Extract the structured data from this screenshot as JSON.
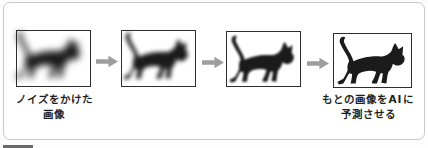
{
  "figure": {
    "steps": [
      {
        "name": "step-1-heavy-noise",
        "icon": "blurred-cat-silhouette"
      },
      {
        "name": "step-2-medium-noise",
        "icon": "blurred-cat-silhouette"
      },
      {
        "name": "step-3-light-noise",
        "icon": "cat-silhouette"
      },
      {
        "name": "step-4-clean-image",
        "icon": "cat-silhouette"
      }
    ],
    "arrow_icon": "right-arrow",
    "captions": {
      "left": {
        "line1": "ノイズをかけた",
        "line2": "画像"
      },
      "right": {
        "line1": "もとの画像をAIに",
        "line2": "予測させる"
      }
    },
    "colors": {
      "cat": "#1b1b1b",
      "panel_border": "#2e2e2e",
      "arrow": "#9e9e9e",
      "frame_border": "#c9c9c9",
      "text": "#1f1f1f",
      "bottom_bar": "#6a6a6a"
    }
  }
}
